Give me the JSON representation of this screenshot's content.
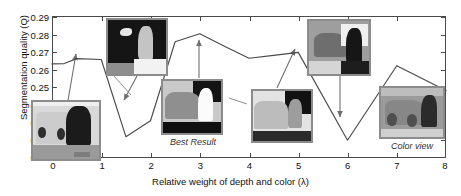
{
  "chart_data": {
    "type": "line",
    "title": "",
    "xlabel": "Relative weight of depth and color (λ)",
    "ylabel": "Segmentation quality (Q)",
    "xlim": [
      0,
      8
    ],
    "ylim": [
      0.21,
      0.29
    ],
    "grid": false,
    "legend": null,
    "xticks": [
      "0",
      "1",
      "2",
      "3",
      "4",
      "5",
      "6",
      "7",
      "8"
    ],
    "yticks": [
      "0.21",
      "0.22",
      "0.23",
      "0.24",
      "0.25",
      "0.26",
      "0.27",
      "0.28",
      "0.29"
    ],
    "series": [
      {
        "name": "Segmentation quality",
        "color": "#4a4a4a",
        "x": [
          0.0,
          0.25,
          0.5,
          1.0,
          1.5,
          2.0,
          2.5,
          3.0,
          3.5,
          4.0,
          4.5,
          5.0,
          6.0,
          7.0,
          8.0
        ],
        "y": [
          0.263,
          0.2632,
          0.266,
          0.2655,
          0.222,
          0.231,
          0.2755,
          0.28,
          0.273,
          0.2662,
          0.2678,
          0.2695,
          0.22,
          0.262,
          0.248
        ]
      }
    ],
    "annotations": [
      {
        "label": "Best Result",
        "x": 3.0,
        "y": 0.28
      },
      {
        "label": "Color view",
        "x": 7.6,
        "y": 0.243
      }
    ]
  },
  "axes": {
    "ylabel": "Segmentation quality (Q)",
    "xlabel": "Relative weight of depth and color (λ)",
    "yticks": [
      "0.29",
      "0.28",
      "0.27",
      "0.26",
      "0.25",
      "0.24",
      "0.23",
      "0.22",
      "0.21"
    ],
    "xticks": [
      "0",
      "1",
      "2",
      "3",
      "4",
      "5",
      "6",
      "7",
      "8"
    ]
  },
  "thumbnails": [
    {
      "name": "segmentation-lambda-0-5",
      "caption": ""
    },
    {
      "name": "segmentation-lambda-1-5",
      "caption": ""
    },
    {
      "name": "segmentation-lambda-3",
      "caption": "Best Result"
    },
    {
      "name": "segmentation-lambda-5",
      "caption": ""
    },
    {
      "name": "segmentation-lambda-6",
      "caption": ""
    },
    {
      "name": "color-view-image",
      "caption": "Color view"
    }
  ],
  "captions": {
    "best_result": "Best Result",
    "color_view": "Color view"
  },
  "colors": {
    "line": "#4a4a4a",
    "axis": "#4a4a4a",
    "thumb_border": "#8c8c8c",
    "text": "#111111",
    "background": "#ffffff"
  }
}
